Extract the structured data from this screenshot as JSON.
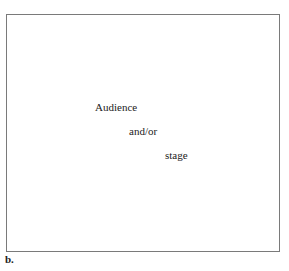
{
  "diagram": {
    "frame": {
      "border_color": "#7a7a7a"
    },
    "labels": [
      {
        "text": "Audience"
      },
      {
        "text": "and/or"
      },
      {
        "text": "stage"
      }
    ],
    "panel_label": "b."
  }
}
